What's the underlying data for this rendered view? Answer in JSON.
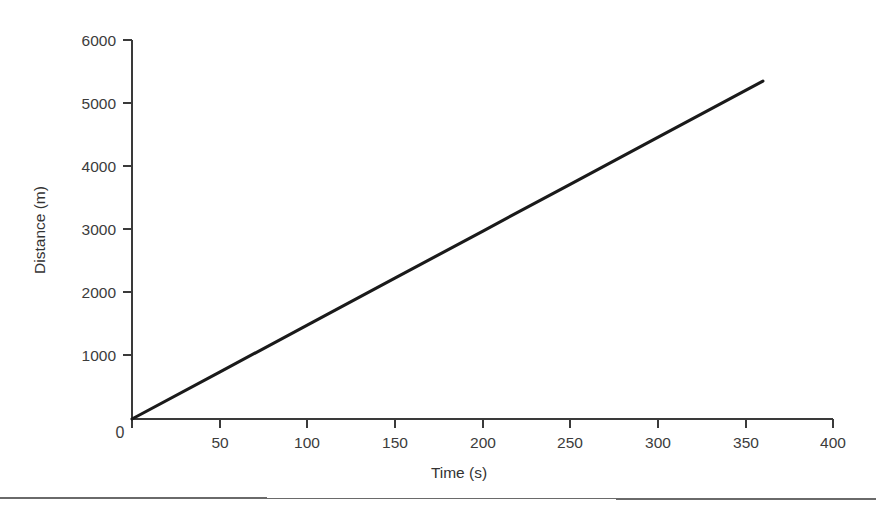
{
  "chart_data": {
    "type": "line",
    "title": "",
    "xlabel": "Time (s)",
    "ylabel": "Distance (m)",
    "xlim": [
      0,
      400
    ],
    "ylim": [
      0,
      6000
    ],
    "xticks": [
      0,
      50,
      100,
      150,
      200,
      250,
      300,
      350,
      400
    ],
    "xtick_labels": [
      "0",
      "50",
      "100",
      "150",
      "200",
      "250",
      "300",
      "350",
      "400"
    ],
    "yticks": [
      0,
      1000,
      2000,
      3000,
      4000,
      5000,
      6000
    ],
    "ytick_labels": [
      "0",
      "1000",
      "2000",
      "3000",
      "4000",
      "5000",
      "6000"
    ],
    "origin_label": "0",
    "grid": false,
    "legend": false,
    "legend_position": "none",
    "series": [
      {
        "name": "Distance vs Time",
        "color": "#1a1a1a",
        "x": [
          0,
          50,
          100,
          150,
          200,
          250,
          300,
          360
        ],
        "values": [
          0,
          743,
          1486,
          2229,
          2972,
          3715,
          4458,
          5350
        ]
      }
    ],
    "annotations": []
  },
  "figure": {
    "background_color": "#ffffff",
    "axis_color": "#3a3a3a",
    "text_color": "#3c3c3c",
    "footer_rule_color": "#6a6a6a"
  }
}
